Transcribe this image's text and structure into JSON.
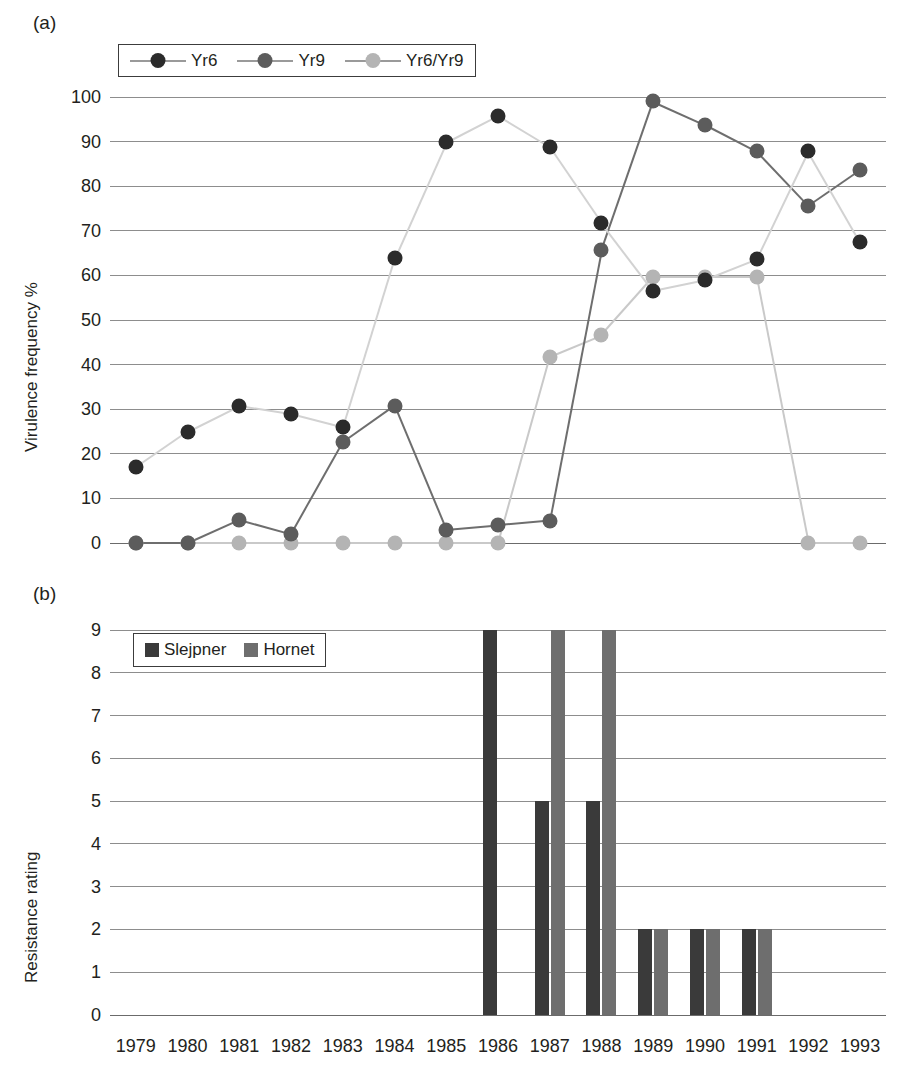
{
  "figure": {
    "panel_a_letter": "(a)",
    "panel_b_letter": "(b)"
  },
  "chart_data": [
    {
      "type": "line",
      "panel": "(a)",
      "title": "",
      "xlabel": "",
      "ylabel": "Virulence frequency %",
      "ylim": [
        0,
        100
      ],
      "ytick_step": 10,
      "yticks": [
        0,
        10,
        20,
        30,
        40,
        50,
        60,
        70,
        80,
        90,
        100
      ],
      "grid": true,
      "legend_position": "top-left",
      "categories": [
        "1979",
        "1980",
        "1981",
        "1982",
        "1983",
        "1984",
        "1985",
        "1986",
        "1987",
        "1988",
        "1989",
        "1990",
        "1991",
        "1992",
        "1993"
      ],
      "series": [
        {
          "name": "Yr6",
          "color": "#2b2b2b",
          "line_color": "#d2d2d2",
          "values": [
            17,
            25,
            30.8,
            29,
            26,
            63.8,
            89.8,
            95.8,
            88.8,
            71.8,
            56.6,
            59,
            63.6,
            87.8,
            67.6
          ]
        },
        {
          "name": "Yr9",
          "color": "#5c5c5c",
          "line_color": "#6e6e6e",
          "values": [
            0,
            0,
            5.2,
            2,
            22.6,
            30.8,
            3,
            4,
            5,
            65.6,
            99,
            93.8,
            87.8,
            75.6,
            83.6
          ]
        },
        {
          "name": "Yr6/Yr9",
          "color": "#b4b4b4",
          "line_color": "#c9c9c9",
          "values": [
            0,
            0,
            0,
            0,
            0,
            0,
            0,
            0,
            41.8,
            46.6,
            59.6,
            59.6,
            59.6,
            0,
            0
          ]
        }
      ]
    },
    {
      "type": "bar",
      "panel": "(b)",
      "title": "",
      "xlabel": "",
      "ylabel": "Resistance rating",
      "ylim": [
        0,
        9
      ],
      "ytick_step": 1,
      "yticks": [
        0,
        1,
        2,
        3,
        4,
        5,
        6,
        7,
        8,
        9
      ],
      "grid": true,
      "legend_position": "top-left",
      "categories": [
        "1979",
        "1980",
        "1981",
        "1982",
        "1983",
        "1984",
        "1985",
        "1986",
        "1987",
        "1988",
        "1989",
        "1990",
        "1991",
        "1992",
        "1993"
      ],
      "series": [
        {
          "name": "Slejpner",
          "color": "#3a3a3a",
          "values": [
            0,
            0,
            0,
            0,
            0,
            0,
            0,
            9,
            5,
            5,
            2,
            2,
            2,
            0,
            0
          ]
        },
        {
          "name": "Hornet",
          "color": "#6e6e6e",
          "values": [
            0,
            0,
            0,
            0,
            0,
            0,
            0,
            0,
            9,
            9,
            2,
            2,
            2,
            0,
            0
          ]
        }
      ]
    }
  ]
}
